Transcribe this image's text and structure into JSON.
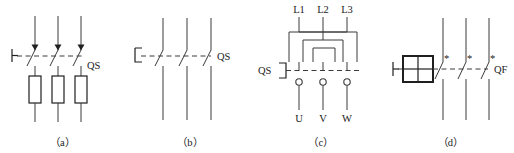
{
  "figure": {
    "type": "electrical-schematic-symbols",
    "background_color": "#ffffff",
    "line_color": "#3a3a3a",
    "text_color": "#1a1a1a",
    "width": 514,
    "height": 153
  },
  "panels": [
    {
      "id": "a",
      "caption": "（a）",
      "device_label": "QS",
      "description": "three-pole isolating switch with fuses",
      "poles": 3,
      "actuator_symbol": "manual-actuator-tee",
      "has_fuses": true,
      "fuse_count": 3,
      "contact_marker": "arrow-down",
      "linkage": "dashed-mechanical-link"
    },
    {
      "id": "b",
      "caption": "（b）",
      "device_label": "QS",
      "description": "three-pole isolating switch",
      "poles": 3,
      "actuator_symbol": "bracket-actuator",
      "has_fuses": false,
      "fuse_count": 0,
      "contact_marker": "none",
      "linkage": "dashed-mechanical-link"
    },
    {
      "id": "c",
      "caption": "（c）",
      "device_label": "QS",
      "description": "three-pole reversing changeover switch",
      "poles": 3,
      "actuator_symbol": "bracket-actuator",
      "has_fuses": false,
      "fuse_count": 0,
      "contact_marker": "open-terminal-circle",
      "linkage": "dashed-mechanical-link",
      "input_terminals": [
        "L1",
        "L2",
        "L3"
      ],
      "output_terminals": [
        "U",
        "V",
        "W"
      ]
    },
    {
      "id": "d",
      "caption": "（d）",
      "device_label": "QF",
      "description": "three-pole circuit breaker with operating mechanism",
      "poles": 3,
      "actuator_symbol": "manual-actuator-tee",
      "has_fuses": false,
      "fuse_count": 0,
      "contact_marker": "asterisk",
      "linkage": "dashed-mechanical-link",
      "mechanism_box": "four-quadrant-square"
    }
  ]
}
